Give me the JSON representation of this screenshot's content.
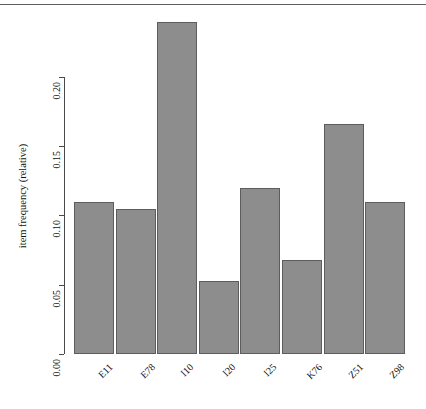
{
  "figure": {
    "background_color": "#ffffff",
    "bar_fill_color": "#8d8d8d",
    "bar_border_color": "#5d5d5d",
    "axis_color": "#4a4a4a"
  },
  "chart_data": {
    "type": "bar",
    "title": "",
    "xlabel": "",
    "ylabel": "item frequency (relative)",
    "categories": [
      "E11",
      "E78",
      "I10",
      "I20",
      "I25",
      "K76",
      "Z51",
      "Z98"
    ],
    "values": [
      0.11,
      0.105,
      0.24,
      0.053,
      0.12,
      0.068,
      0.166,
      0.11
    ],
    "ylim": [
      0.0,
      0.24
    ],
    "yticks": [
      0.0,
      0.05,
      0.1,
      0.15,
      0.2
    ],
    "ytick_labels": [
      "0.00",
      "0.05",
      "0.10",
      "0.15",
      "0.20"
    ],
    "grid": false,
    "legend": null,
    "legend_position": "none",
    "xtick_rotation_degrees": 45
  }
}
